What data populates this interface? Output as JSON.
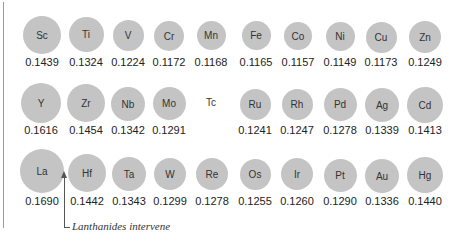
{
  "rows": [
    {
      "period": 4,
      "elements": [
        {
          "symbol": "Sc",
          "radius": "0.1439",
          "cx": 42,
          "cy": 35,
          "d": 38
        },
        {
          "symbol": "Ti",
          "radius": "0.1324",
          "cx": 86,
          "cy": 34,
          "d": 35
        },
        {
          "symbol": "V",
          "radius": "0.1224",
          "cx": 128,
          "cy": 35,
          "d": 31
        },
        {
          "symbol": "Cr",
          "radius": "0.1172",
          "cx": 169,
          "cy": 36,
          "d": 30
        },
        {
          "symbol": "Mn",
          "radius": "0.1168",
          "cx": 211,
          "cy": 35,
          "d": 29
        },
        {
          "symbol": "Fe",
          "radius": "0.1165",
          "cx": 256,
          "cy": 35,
          "d": 29
        },
        {
          "symbol": "Co",
          "radius": "0.1157",
          "cx": 298,
          "cy": 36,
          "d": 28
        },
        {
          "symbol": "Ni",
          "radius": "0.1149",
          "cx": 340,
          "cy": 36,
          "d": 29
        },
        {
          "symbol": "Cu",
          "radius": "0.1173",
          "cx": 381,
          "cy": 37,
          "d": 31
        },
        {
          "symbol": "Zn",
          "radius": "0.1249",
          "cx": 425,
          "cy": 37,
          "d": 32
        }
      ]
    },
    {
      "period": 5,
      "elements": [
        {
          "symbol": "Y",
          "radius": "0.1616",
          "cx": 41,
          "cy": 103,
          "d": 40
        },
        {
          "symbol": "Zr",
          "radius": "0.1454",
          "cx": 86,
          "cy": 103,
          "d": 38
        },
        {
          "symbol": "Nb",
          "radius": "0.1342",
          "cx": 128,
          "cy": 104,
          "d": 34
        },
        {
          "symbol": "Mo",
          "radius": "0.1291",
          "cx": 169,
          "cy": 103,
          "d": 33
        },
        {
          "symbol": "Tc",
          "radius": "",
          "cx": 211,
          "cy": 104,
          "d": 0
        },
        {
          "symbol": "Ru",
          "radius": "0.1241",
          "cx": 255,
          "cy": 104,
          "d": 31
        },
        {
          "symbol": "Rh",
          "radius": "0.1247",
          "cx": 297,
          "cy": 104,
          "d": 31
        },
        {
          "symbol": "Pd",
          "radius": "0.1278",
          "cx": 340,
          "cy": 104,
          "d": 33
        },
        {
          "symbol": "Ag",
          "radius": "0.1339",
          "cx": 382,
          "cy": 105,
          "d": 34
        },
        {
          "symbol": "Cd",
          "radius": "0.1413",
          "cx": 425,
          "cy": 105,
          "d": 36
        }
      ]
    },
    {
      "period": 6,
      "elements": [
        {
          "symbol": "La",
          "radius": "0.1690",
          "cx": 42,
          "cy": 171,
          "d": 44
        },
        {
          "symbol": "Hf",
          "radius": "0.1442",
          "cx": 87,
          "cy": 173,
          "d": 38
        },
        {
          "symbol": "Ta",
          "radius": "0.1343",
          "cx": 129,
          "cy": 174,
          "d": 34
        },
        {
          "symbol": "W",
          "radius": "0.1299",
          "cx": 170,
          "cy": 174,
          "d": 32
        },
        {
          "symbol": "Re",
          "radius": "0.1278",
          "cx": 212,
          "cy": 174,
          "d": 32
        },
        {
          "symbol": "Os",
          "radius": "0.1255",
          "cx": 255,
          "cy": 174,
          "d": 31
        },
        {
          "symbol": "Ir",
          "radius": "0.1260",
          "cx": 297,
          "cy": 174,
          "d": 32
        },
        {
          "symbol": "Pt",
          "radius": "0.1290",
          "cx": 340,
          "cy": 175,
          "d": 33
        },
        {
          "symbol": "Au",
          "radius": "0.1336",
          "cx": 382,
          "cy": 176,
          "d": 34
        },
        {
          "symbol": "Hg",
          "radius": "0.1440",
          "cx": 425,
          "cy": 175,
          "d": 36
        }
      ]
    }
  ],
  "annotation": "Lanthanides intervene",
  "colors": {
    "circle": "#c4c4c4",
    "text": "#222222",
    "rule": "#9a9a9a"
  }
}
